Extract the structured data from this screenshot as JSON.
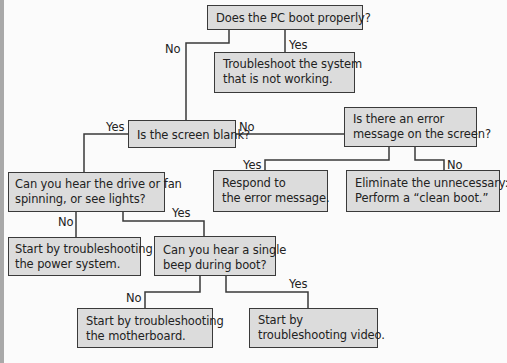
{
  "flowchart": {
    "nodes": [
      {
        "id": "boot",
        "type": "decision",
        "lines": [
          "Does the PC boot properly?"
        ]
      },
      {
        "id": "troubleshoot-system",
        "type": "action",
        "lines": [
          "Troubleshoot the system",
          "that is not working."
        ]
      },
      {
        "id": "screen-blank",
        "type": "decision",
        "lines": [
          "Is the screen blank?"
        ]
      },
      {
        "id": "error-message",
        "type": "decision",
        "lines": [
          "Is there an error",
          "message on the screen?"
        ]
      },
      {
        "id": "respond-error",
        "type": "action",
        "lines": [
          "Respond to",
          "the error message."
        ]
      },
      {
        "id": "clean-boot",
        "type": "action",
        "lines": [
          "Eliminate the unnecessary:",
          "Perform a “clean boot.”"
        ]
      },
      {
        "id": "drive-fan",
        "type": "decision",
        "lines": [
          "Can you hear the drive or fan",
          "spinning, or see lights?"
        ]
      },
      {
        "id": "power-system",
        "type": "action",
        "lines": [
          "Start by troubleshooting",
          "the power system."
        ]
      },
      {
        "id": "single-beep",
        "type": "decision",
        "lines": [
          "Can you hear a single",
          "beep during boot?"
        ]
      },
      {
        "id": "motherboard",
        "type": "action",
        "lines": [
          "Start by troubleshooting",
          "the motherboard."
        ]
      },
      {
        "id": "video",
        "type": "action",
        "lines": [
          "Start by",
          "troubleshooting video."
        ]
      }
    ],
    "edges": [
      {
        "from": "boot",
        "to": "screen-blank",
        "label": "No"
      },
      {
        "from": "boot",
        "to": "troubleshoot-system",
        "label": "Yes"
      },
      {
        "from": "screen-blank",
        "to": "drive-fan",
        "label": "Yes"
      },
      {
        "from": "screen-blank",
        "to": "error-message",
        "label": "No"
      },
      {
        "from": "error-message",
        "to": "respond-error",
        "label": "Yes"
      },
      {
        "from": "error-message",
        "to": "clean-boot",
        "label": "No"
      },
      {
        "from": "drive-fan",
        "to": "power-system",
        "label": "No"
      },
      {
        "from": "drive-fan",
        "to": "single-beep",
        "label": "Yes"
      },
      {
        "from": "single-beep",
        "to": "motherboard",
        "label": "No"
      },
      {
        "from": "single-beep",
        "to": "video",
        "label": "Yes"
      }
    ]
  },
  "colors": {
    "box_fill": "#dcdcdc",
    "box_border": "#3a3a3a",
    "text": "#222222",
    "background": "#fbfbfb",
    "left_bar": "#a9a9a9"
  }
}
